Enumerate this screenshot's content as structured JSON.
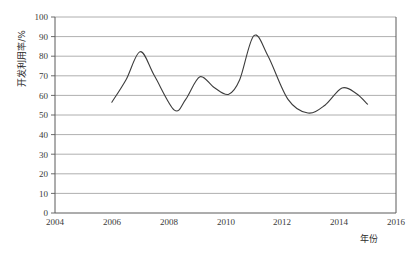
{
  "chart_data": {
    "type": "line",
    "title": "",
    "subtitle": "",
    "xlabel": "年份",
    "ylabel": "开发利用率/%",
    "xlim": [
      2004,
      2016
    ],
    "ylim": [
      0,
      100
    ],
    "grid": true,
    "legend": false,
    "legend_position": "none",
    "x_ticks": [
      "2004",
      "2006",
      "2008",
      "2010",
      "2012",
      "2014",
      "2016"
    ],
    "y_ticks": [
      "0",
      "10",
      "20",
      "30",
      "40",
      "50",
      "60",
      "70",
      "80",
      "90",
      "100"
    ],
    "series": [
      {
        "name": "开发利用率",
        "color": "#3c3c3c",
        "x": [
          2006.0,
          2006.5,
          2007.0,
          2007.5,
          2008.2,
          2008.6,
          2009.1,
          2009.6,
          2010.1,
          2010.5,
          2011.0,
          2011.5,
          2012.2,
          2012.9,
          2013.5,
          2014.1,
          2014.6,
          2015.0
        ],
        "values": [
          56.5,
          68.0,
          82.3,
          70.0,
          52.5,
          58.0,
          69.5,
          64.0,
          60.5,
          68.0,
          90.5,
          80.0,
          58.0,
          51.0,
          55.0,
          63.8,
          61.0,
          55.5
        ]
      }
    ],
    "annotations": []
  },
  "axes": {
    "y_title": "开发利用率/%",
    "x_title": "年份"
  }
}
